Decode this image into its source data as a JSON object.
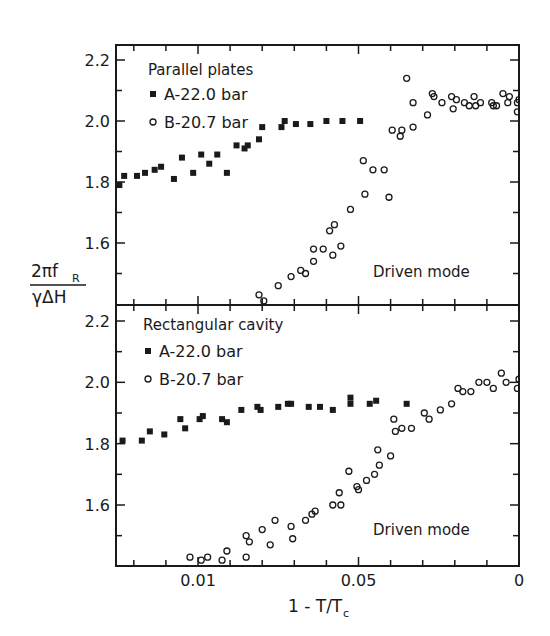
{
  "figure": {
    "ylabel_numerator": "2πf",
    "ylabel_sub": "R",
    "ylabel_denominator": "γΔH",
    "xlabel": "1 - T/T",
    "xlabel_sub": "c",
    "x_tick_positions": [
      0,
      1,
      2,
      3,
      4,
      5,
      6,
      7,
      8,
      9,
      10,
      11,
      12
    ],
    "x_major_ticks": [
      {
        "pos": 2,
        "label": "0.01"
      },
      {
        "pos": 7,
        "label": "0.05"
      },
      {
        "pos": 12,
        "label": "0"
      }
    ],
    "x_axis_note": "x values are expressed in tick units (0 = first minor tick near left frame, 12 = right frame at 1-T/Tc = 0)"
  },
  "chart_data": [
    {
      "type": "scatter",
      "title": "Parallel plates",
      "annotation": "Driven mode",
      "xlabel": "1 - T/Tc",
      "ylabel": "2πf_R / γΔH",
      "ylim": [
        1.42,
        2.26
      ],
      "y_ticks": [
        {
          "v": 2.2,
          "label": "2.2"
        },
        {
          "v": 2.0,
          "label": "2.0"
        },
        {
          "v": 1.8,
          "label": "1.8"
        },
        {
          "v": 1.6,
          "label": "1.6"
        }
      ],
      "y_minor_ticks": [
        2.1,
        1.9,
        1.7,
        1.5
      ],
      "legend": [
        {
          "marker": "filled-square",
          "label": "A-22.0 bar"
        },
        {
          "marker": "open-circle",
          "label": "B-20.7 bar"
        }
      ],
      "series": [
        {
          "name": "A-22.0 bar",
          "marker": "filled-square",
          "points": [
            [
              -0.45,
              1.79
            ],
            [
              -0.3,
              1.82
            ],
            [
              0.1,
              1.82
            ],
            [
              0.35,
              1.83
            ],
            [
              0.65,
              1.84
            ],
            [
              0.85,
              1.85
            ],
            [
              1.25,
              1.81
            ],
            [
              1.5,
              1.88
            ],
            [
              1.85,
              1.83
            ],
            [
              2.1,
              1.89
            ],
            [
              2.35,
              1.86
            ],
            [
              2.6,
              1.89
            ],
            [
              2.9,
              1.83
            ],
            [
              3.2,
              1.92
            ],
            [
              3.45,
              1.91
            ],
            [
              3.55,
              1.92
            ],
            [
              3.9,
              1.94
            ],
            [
              4.0,
              1.98
            ],
            [
              4.6,
              1.98
            ],
            [
              4.7,
              2.0
            ],
            [
              5.05,
              1.99
            ],
            [
              5.5,
              1.99
            ],
            [
              6.0,
              2.0
            ],
            [
              6.5,
              2.0
            ],
            [
              7.05,
              2.0
            ]
          ]
        },
        {
          "name": "B-20.7 bar",
          "marker": "open-circle",
          "points": [
            [
              3.9,
              1.43
            ],
            [
              4.05,
              1.41
            ],
            [
              4.5,
              1.46
            ],
            [
              4.9,
              1.49
            ],
            [
              5.2,
              1.51
            ],
            [
              5.35,
              1.5
            ],
            [
              5.6,
              1.54
            ],
            [
              5.6,
              1.58
            ],
            [
              5.9,
              1.58
            ],
            [
              6.2,
              1.56
            ],
            [
              6.1,
              1.64
            ],
            [
              6.45,
              1.59
            ],
            [
              6.25,
              1.66
            ],
            [
              6.75,
              1.71
            ],
            [
              7.2,
              1.76
            ],
            [
              7.15,
              1.87
            ],
            [
              7.45,
              1.84
            ],
            [
              7.8,
              1.84
            ],
            [
              7.95,
              1.75
            ],
            [
              8.05,
              1.97
            ],
            [
              8.3,
              1.95
            ],
            [
              8.35,
              1.97
            ],
            [
              8.5,
              2.14
            ],
            [
              8.7,
              1.98
            ],
            [
              8.7,
              2.06
            ],
            [
              9.15,
              2.02
            ],
            [
              9.3,
              2.09
            ],
            [
              9.35,
              2.08
            ],
            [
              9.6,
              2.06
            ],
            [
              9.9,
              2.08
            ],
            [
              9.95,
              2.04
            ],
            [
              10.05,
              2.07
            ],
            [
              10.3,
              2.06
            ],
            [
              10.45,
              2.05
            ],
            [
              10.6,
              2.08
            ],
            [
              10.65,
              2.05
            ],
            [
              10.8,
              2.06
            ],
            [
              11.15,
              2.06
            ],
            [
              11.2,
              2.05
            ],
            [
              11.3,
              2.05
            ],
            [
              11.5,
              2.09
            ],
            [
              11.65,
              2.06
            ],
            [
              11.7,
              2.08
            ],
            [
              11.95,
              2.06
            ],
            [
              12.0,
              2.07
            ],
            [
              11.95,
              2.03
            ]
          ]
        }
      ]
    },
    {
      "type": "scatter",
      "title": "Rectangular cavity",
      "annotation": "Driven mode",
      "xlabel": "1 - T/Tc",
      "ylabel": "2πf_R / γΔH",
      "ylim": [
        1.42,
        2.26
      ],
      "y_ticks": [
        {
          "v": 2.2,
          "label": "2.2"
        },
        {
          "v": 2.0,
          "label": "2.0"
        },
        {
          "v": 1.8,
          "label": "1.8"
        },
        {
          "v": 1.6,
          "label": "1.6"
        }
      ],
      "y_minor_ticks": [
        2.1,
        1.9,
        1.7,
        1.5
      ],
      "legend": [
        {
          "marker": "filled-square",
          "label": "A-22.0 bar"
        },
        {
          "marker": "open-circle",
          "label": "B-20.7 bar"
        }
      ],
      "series": [
        {
          "name": "A-22.0 bar",
          "marker": "filled-square",
          "points": [
            [
              -0.35,
              1.81
            ],
            [
              0.25,
              1.81
            ],
            [
              0.5,
              1.84
            ],
            [
              0.95,
              1.83
            ],
            [
              1.45,
              1.88
            ],
            [
              1.6,
              1.85
            ],
            [
              2.05,
              1.88
            ],
            [
              2.15,
              1.89
            ],
            [
              2.75,
              1.88
            ],
            [
              2.9,
              1.87
            ],
            [
              3.35,
              1.91
            ],
            [
              3.85,
              1.92
            ],
            [
              3.95,
              1.91
            ],
            [
              4.5,
              1.92
            ],
            [
              4.8,
              1.93
            ],
            [
              4.9,
              1.93
            ],
            [
              5.45,
              1.92
            ],
            [
              5.8,
              1.92
            ],
            [
              6.2,
              1.91
            ],
            [
              6.75,
              1.93
            ],
            [
              6.75,
              1.95
            ],
            [
              7.35,
              1.93
            ],
            [
              7.55,
              1.94
            ],
            [
              8.5,
              1.93
            ]
          ]
        },
        {
          "name": "B-20.7 bar",
          "marker": "open-circle",
          "points": [
            [
              1.75,
              1.43
            ],
            [
              2.1,
              1.42
            ],
            [
              2.3,
              1.43
            ],
            [
              2.75,
              1.42
            ],
            [
              2.9,
              1.45
            ],
            [
              3.5,
              1.5
            ],
            [
              3.6,
              1.48
            ],
            [
              3.5,
              1.43
            ],
            [
              4.0,
              1.52
            ],
            [
              4.25,
              1.47
            ],
            [
              4.4,
              1.55
            ],
            [
              4.9,
              1.53
            ],
            [
              4.95,
              1.49
            ],
            [
              5.35,
              1.55
            ],
            [
              5.55,
              1.57
            ],
            [
              5.65,
              1.58
            ],
            [
              6.2,
              1.6
            ],
            [
              6.4,
              1.64
            ],
            [
              6.45,
              1.6
            ],
            [
              6.7,
              1.71
            ],
            [
              6.95,
              1.66
            ],
            [
              7.0,
              1.65
            ],
            [
              7.25,
              1.68
            ],
            [
              7.5,
              1.7
            ],
            [
              7.65,
              1.73
            ],
            [
              7.6,
              1.78
            ],
            [
              8.0,
              1.76
            ],
            [
              8.15,
              1.84
            ],
            [
              8.1,
              1.88
            ],
            [
              8.35,
              1.85
            ],
            [
              8.65,
              1.85
            ],
            [
              9.05,
              1.9
            ],
            [
              9.2,
              1.88
            ],
            [
              9.55,
              1.91
            ],
            [
              9.9,
              1.93
            ],
            [
              10.1,
              1.98
            ],
            [
              10.25,
              1.97
            ],
            [
              10.5,
              1.97
            ],
            [
              10.75,
              2.0
            ],
            [
              11.0,
              2.0
            ],
            [
              11.45,
              2.03
            ],
            [
              11.6,
              2.0
            ],
            [
              11.2,
              1.98
            ],
            [
              12.0,
              2.01
            ],
            [
              11.95,
              1.98
            ]
          ]
        }
      ]
    }
  ]
}
